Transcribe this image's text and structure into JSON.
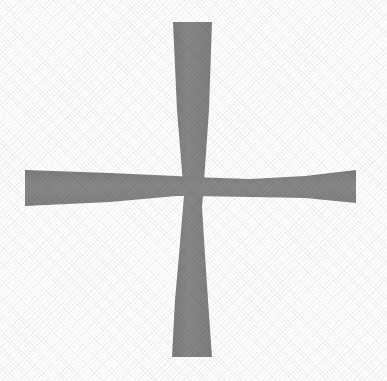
{
  "image": {
    "title": "Cross / plus symbol",
    "kind": "scanned-symbol",
    "width": 387,
    "height": 381,
    "background_color": "#ffffff",
    "stroke_color": "#838383",
    "description": "A large hand-drawn plus sign with two crossing tapered bars on a plain white background."
  },
  "figure": {
    "symbol_name": "plus-cross",
    "center": {
      "x": 193,
      "y": 188
    },
    "fill_color": "#838383",
    "fill_color_dark": "#7a7a7a",
    "fill_color_light": "#8c8c8c",
    "outline": "none",
    "parts": [
      {
        "name": "vertical-bar",
        "orientation": "vertical",
        "shape": "bowtie-taper",
        "top_y": 22,
        "bottom_y": 357,
        "top_left_x": 173,
        "top_right_x": 212,
        "top_width": 39,
        "waist_y": 207,
        "waist_left_x": 184,
        "waist_right_x": 202,
        "waist_width": 18,
        "bottom_left_x": 172,
        "bottom_right_x": 212,
        "bottom_width": 40
      },
      {
        "name": "horizontal-bar",
        "orientation": "horizontal",
        "shape": "bowtie-taper",
        "left_x": 25,
        "right_x": 356,
        "left_top_y": 170,
        "left_bottom_y": 206,
        "left_height": 36,
        "waist_x": 193,
        "waist_top_y": 177,
        "waist_bottom_y": 196,
        "waist_height": 19,
        "right_top_y": 170,
        "right_bottom_y": 203,
        "right_height": 33
      }
    ],
    "path_vertical": "M 173,22 L 212,22 L 209,110 L 203,196 L 202,207 L 205,255 L 208,300 L 212,357 L 172,357 L 175,300 L 179,255 L 183,207 L 184,196 L 177,110 Z",
    "path_horizontal": "M 25,170 L 110,173 L 176,176 L 193,177 L 250,179 L 305,176 L 356,170 L 356,203 L 305,198 L 250,197 L 193,196 L 176,196 L 110,202 L 25,206 Z"
  }
}
